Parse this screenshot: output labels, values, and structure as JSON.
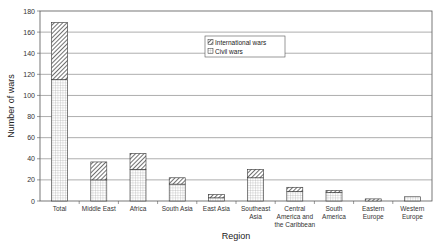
{
  "chart_data": {
    "type": "bar",
    "stacked": true,
    "title": "",
    "xlabel": "Region",
    "ylabel": "Number of wars",
    "ylim": [
      0,
      180
    ],
    "yticks": [
      0,
      20,
      40,
      60,
      80,
      100,
      120,
      140,
      160,
      180
    ],
    "grid": true,
    "legend_position": "upper center inside",
    "categories": [
      "Total",
      "Middle East",
      "Africa",
      "South Asia",
      "East Asia",
      "Southeast Asia",
      "Central America and the Caribbean",
      "South America",
      "Eastern Europe",
      "Western Europe"
    ],
    "category_lines": [
      [
        "Total"
      ],
      [
        "Middle East"
      ],
      [
        "Africa"
      ],
      [
        "South Asia"
      ],
      [
        "East Asia"
      ],
      [
        "Southeast",
        "Asia"
      ],
      [
        "Central",
        "America and",
        "the Caribbean"
      ],
      [
        "South",
        "America"
      ],
      [
        "Eastern",
        "Europe"
      ],
      [
        "Western",
        "Europe"
      ]
    ],
    "series": [
      {
        "name": "Civil wars",
        "pattern": "grid",
        "values": [
          115,
          20,
          30,
          16,
          3,
          22,
          9,
          8,
          0,
          4
        ]
      },
      {
        "name": "International wars",
        "pattern": "hatch",
        "values": [
          54,
          17,
          15,
          6,
          3,
          8,
          4,
          2,
          2,
          0
        ]
      }
    ]
  },
  "legend": {
    "items": [
      "International wars",
      "Civil wars"
    ]
  }
}
